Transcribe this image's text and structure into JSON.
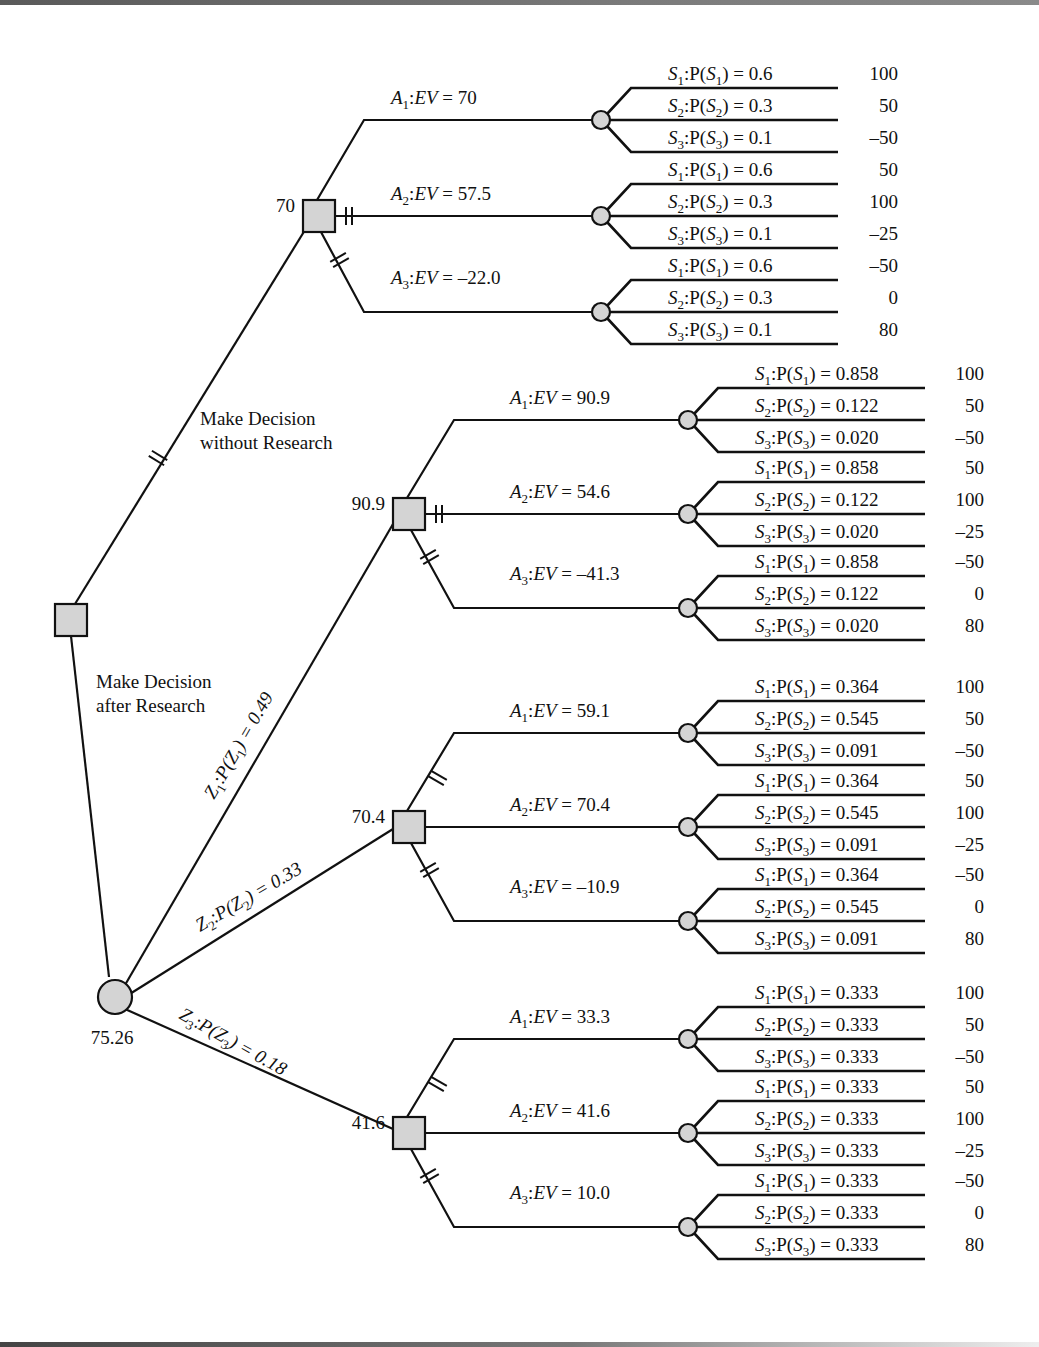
{
  "diagram": {
    "type": "decision-tree",
    "root": {
      "node_type": "decision",
      "branches": [
        {
          "label_lines": [
            "Make Decision",
            "without Research"
          ],
          "pruned": true,
          "decision_node": {
            "value": "70",
            "alternatives": [
              {
                "name": "A1",
                "ev": "70",
                "pruned": false,
                "states": [
                  {
                    "state": "S1",
                    "prob": "0.6",
                    "payoff": "100"
                  },
                  {
                    "state": "S2",
                    "prob": "0.3",
                    "payoff": "50"
                  },
                  {
                    "state": "S3",
                    "prob": "0.1",
                    "payoff": "–50"
                  }
                ]
              },
              {
                "name": "A2",
                "ev": "57.5",
                "pruned": true,
                "states": [
                  {
                    "state": "S1",
                    "prob": "0.6",
                    "payoff": "50"
                  },
                  {
                    "state": "S2",
                    "prob": "0.3",
                    "payoff": "100"
                  },
                  {
                    "state": "S3",
                    "prob": "0.1",
                    "payoff": "–25"
                  }
                ]
              },
              {
                "name": "A3",
                "ev": "–22.0",
                "pruned": true,
                "states": [
                  {
                    "state": "S1",
                    "prob": "0.6",
                    "payoff": "–50"
                  },
                  {
                    "state": "S2",
                    "prob": "0.3",
                    "payoff": "0"
                  },
                  {
                    "state": "S3",
                    "prob": "0.1",
                    "payoff": "80"
                  }
                ]
              }
            ]
          }
        },
        {
          "label_lines": [
            "Make Decision",
            "after Research"
          ],
          "pruned": false,
          "chance_node": {
            "value": "75.26",
            "indications": [
              {
                "name": "Z1",
                "prob": "0.49",
                "decision_value": "90.9",
                "alternatives": [
                  {
                    "name": "A1",
                    "ev": "90.9",
                    "pruned": false,
                    "states": [
                      {
                        "state": "S1",
                        "prob": "0.858",
                        "payoff": "100"
                      },
                      {
                        "state": "S2",
                        "prob": "0.122",
                        "payoff": "50"
                      },
                      {
                        "state": "S3",
                        "prob": "0.020",
                        "payoff": "–50"
                      }
                    ]
                  },
                  {
                    "name": "A2",
                    "ev": "54.6",
                    "pruned": true,
                    "states": [
                      {
                        "state": "S1",
                        "prob": "0.858",
                        "payoff": "50"
                      },
                      {
                        "state": "S2",
                        "prob": "0.122",
                        "payoff": "100"
                      },
                      {
                        "state": "S3",
                        "prob": "0.020",
                        "payoff": "–25"
                      }
                    ]
                  },
                  {
                    "name": "A3",
                    "ev": "–41.3",
                    "pruned": true,
                    "states": [
                      {
                        "state": "S1",
                        "prob": "0.858",
                        "payoff": "–50"
                      },
                      {
                        "state": "S2",
                        "prob": "0.122",
                        "payoff": "0"
                      },
                      {
                        "state": "S3",
                        "prob": "0.020",
                        "payoff": "80"
                      }
                    ]
                  }
                ]
              },
              {
                "name": "Z2",
                "prob": "0.33",
                "decision_value": "70.4",
                "alternatives": [
                  {
                    "name": "A1",
                    "ev": "59.1",
                    "pruned": true,
                    "states": [
                      {
                        "state": "S1",
                        "prob": "0.364",
                        "payoff": "100"
                      },
                      {
                        "state": "S2",
                        "prob": "0.545",
                        "payoff": "50"
                      },
                      {
                        "state": "S3",
                        "prob": "0.091",
                        "payoff": "–50"
                      }
                    ]
                  },
                  {
                    "name": "A2",
                    "ev": "70.4",
                    "pruned": false,
                    "states": [
                      {
                        "state": "S1",
                        "prob": "0.364",
                        "payoff": "50"
                      },
                      {
                        "state": "S2",
                        "prob": "0.545",
                        "payoff": "100"
                      },
                      {
                        "state": "S3",
                        "prob": "0.091",
                        "payoff": "–25"
                      }
                    ]
                  },
                  {
                    "name": "A3",
                    "ev": "–10.9",
                    "pruned": true,
                    "states": [
                      {
                        "state": "S1",
                        "prob": "0.364",
                        "payoff": "–50"
                      },
                      {
                        "state": "S2",
                        "prob": "0.545",
                        "payoff": "0"
                      },
                      {
                        "state": "S3",
                        "prob": "0.091",
                        "payoff": "80"
                      }
                    ]
                  }
                ]
              },
              {
                "name": "Z3",
                "prob": "0.18",
                "decision_value": "41.6",
                "alternatives": [
                  {
                    "name": "A1",
                    "ev": "33.3",
                    "pruned": true,
                    "states": [
                      {
                        "state": "S1",
                        "prob": "0.333",
                        "payoff": "100"
                      },
                      {
                        "state": "S2",
                        "prob": "0.333",
                        "payoff": "50"
                      },
                      {
                        "state": "S3",
                        "prob": "0.333",
                        "payoff": "–50"
                      }
                    ]
                  },
                  {
                    "name": "A2",
                    "ev": "41.6",
                    "pruned": false,
                    "states": [
                      {
                        "state": "S1",
                        "prob": "0.333",
                        "payoff": "50"
                      },
                      {
                        "state": "S2",
                        "prob": "0.333",
                        "payoff": "100"
                      },
                      {
                        "state": "S3",
                        "prob": "0.333",
                        "payoff": "–25"
                      }
                    ]
                  },
                  {
                    "name": "A3",
                    "ev": "10.0",
                    "pruned": true,
                    "states": [
                      {
                        "state": "S1",
                        "prob": "0.333",
                        "payoff": "–50"
                      },
                      {
                        "state": "S2",
                        "prob": "0.333",
                        "payoff": "0"
                      },
                      {
                        "state": "S3",
                        "prob": "0.333",
                        "payoff": "80"
                      }
                    ]
                  }
                ]
              }
            ]
          }
        }
      ]
    },
    "colors": {
      "line": "#111111",
      "node_fill": "#d4d4d4",
      "background": "#ffffff"
    }
  }
}
